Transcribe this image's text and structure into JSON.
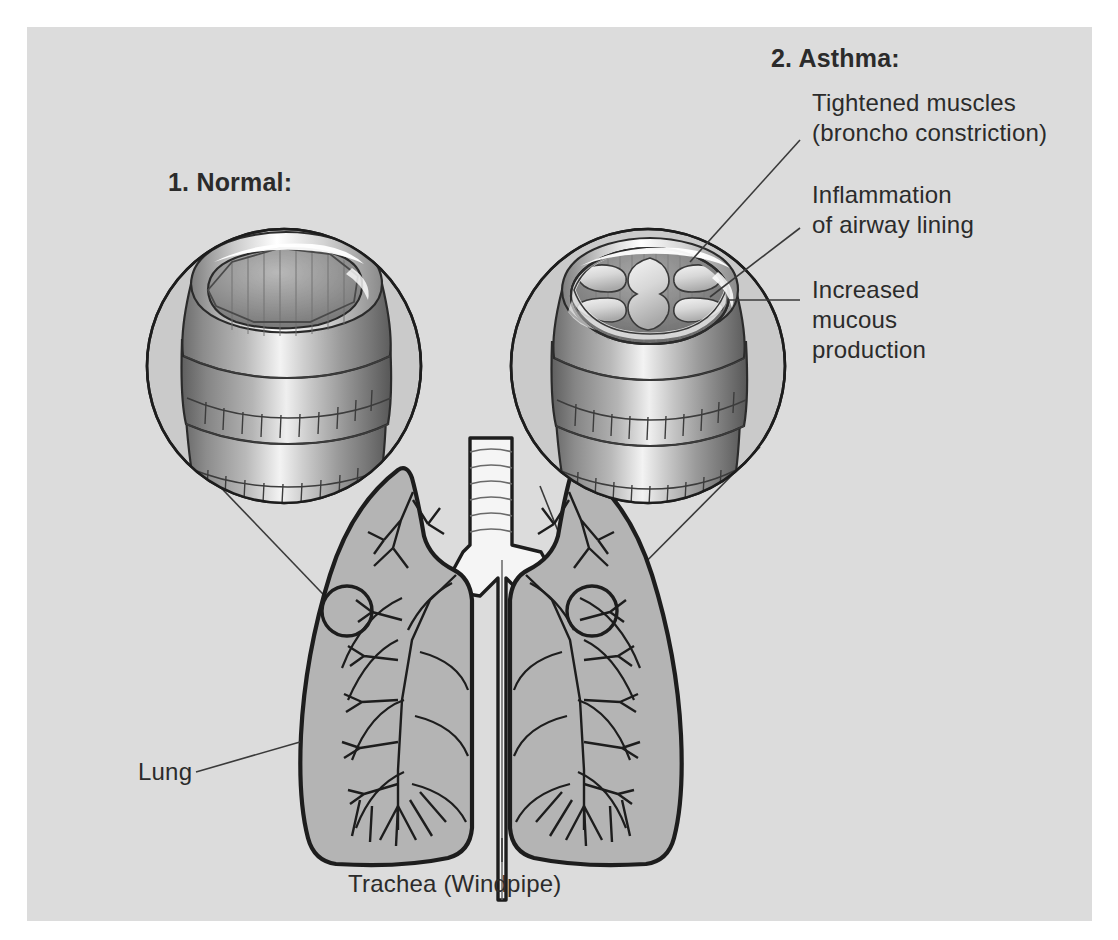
{
  "diagram": {
    "background_color": "#dcdcdc",
    "page_color": "#ffffff",
    "ink_color": "#2b2b2b",
    "lung_fill": "#b4b4b4",
    "trachea_fill": "#f2f2f2"
  },
  "panels": {
    "normal": {
      "title": "1. Normal:",
      "callout_name": "normal-airway-inset"
    },
    "asthma": {
      "title": "2. Asthma:",
      "callout_name": "asthma-airway-inset",
      "labels": [
        {
          "id": "tightened-muscles",
          "line1": "Tightened muscles",
          "line2": "(broncho constriction)"
        },
        {
          "id": "inflammation",
          "line1": "Inflammation",
          "line2": "of airway lining"
        },
        {
          "id": "increased-mucous",
          "line1": "Increased",
          "line2": "mucous",
          "line3": "production"
        }
      ]
    }
  },
  "anatomy": {
    "lung_label": "Lung",
    "trachea_label": "Trachea (Windpipe)"
  }
}
